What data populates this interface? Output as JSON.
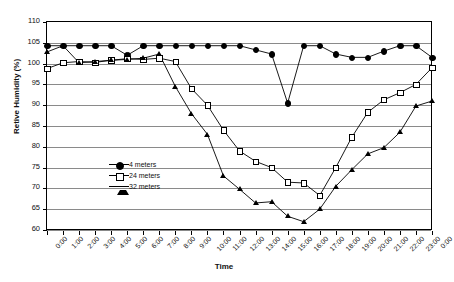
{
  "chart_data": {
    "type": "line",
    "title": "",
    "xlabel": "Time",
    "ylabel": "Retive Humidity (%)",
    "ylim": [
      60,
      110
    ],
    "ytick_step": 5,
    "yticks": [
      110,
      105,
      100,
      95,
      90,
      85,
      80,
      75,
      70,
      65,
      60
    ],
    "grid": true,
    "legend_position": "inside-left-center",
    "x": [
      "0:00",
      "1:00",
      "2:00",
      "3:00",
      "4:00",
      "5:00",
      "6:00",
      "7:00",
      "8:00",
      "9:00",
      "10:00",
      "11:00",
      "12:00",
      "13:00",
      "14:00",
      "15:00",
      "16:00",
      "17:00",
      "18:00",
      "19:00",
      "20:00",
      "21:00",
      "22:00",
      "23:00",
      "0:00"
    ],
    "series": [
      {
        "name": "4 meters",
        "marker": "filled-circle",
        "color": "#000000",
        "values": [
          104.3,
          104.3,
          104.3,
          104.3,
          104.3,
          102.0,
          104.3,
          104.3,
          104.3,
          104.3,
          104.3,
          104.3,
          104.3,
          103.3,
          102.3,
          90.5,
          104.3,
          104.3,
          102.3,
          101.5,
          101.5,
          103.0,
          104.3,
          104.3,
          101.5
        ]
      },
      {
        "name": "24 meters",
        "marker": "open-square",
        "color": "#000000",
        "values": [
          98.8,
          100.2,
          100.5,
          100.3,
          100.8,
          101.2,
          101.0,
          101.3,
          100.5,
          94.0,
          90.0,
          84.0,
          79.0,
          76.5,
          75.0,
          71.5,
          71.3,
          68.3,
          75.0,
          82.3,
          88.3,
          91.3,
          93.0,
          95.0,
          99.0
        ]
      },
      {
        "name": "32 meters",
        "marker": "filled-triangle",
        "color": "#000000",
        "values": [
          102.8,
          104.3,
          100.2,
          100.5,
          100.8,
          101.0,
          101.3,
          102.3,
          94.5,
          88.0,
          83.0,
          73.0,
          69.8,
          66.5,
          66.8,
          63.3,
          62.0,
          65.0,
          70.5,
          74.5,
          78.3,
          79.8,
          83.5,
          89.8,
          91.0
        ]
      }
    ]
  },
  "legend": {
    "items": [
      {
        "label": "4 meters"
      },
      {
        "label": "24 meters"
      },
      {
        "label": "32 meters"
      }
    ]
  }
}
